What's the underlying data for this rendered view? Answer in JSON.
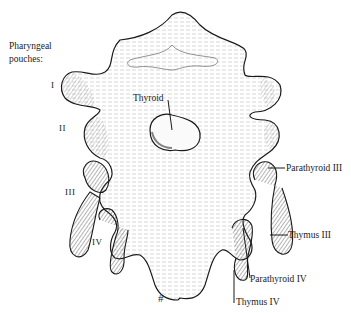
{
  "header_text": "Pharyngeal pouches:",
  "heading": {
    "line1": "Pharyngeal",
    "line2": "pouches:"
  },
  "pouch_numerals": [
    "I",
    "II",
    "III",
    "IV"
  ],
  "labels": {
    "thyroid": "Thyroid",
    "parathyroid_iii": "Parathyroid III",
    "thymus_iii": "Thymus III",
    "parathyroid_iv": "Parathyroid IV",
    "thymus_iv": "Thymus IV"
  },
  "colors": {
    "ink": "#1a1a1a",
    "background": "#ffffff",
    "hatch": "#555555"
  }
}
